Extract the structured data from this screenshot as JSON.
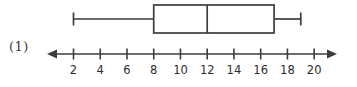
{
  "figure": {
    "item_label": "(1)"
  },
  "chart_data": {
    "type": "boxplot",
    "title": "",
    "label": "(1)",
    "orientation": "horizontal",
    "five_number_summary": {
      "min": 2,
      "q1": 8,
      "median": 12,
      "q3": 17,
      "max": 19
    },
    "axis": {
      "tick_values": [
        2,
        4,
        6,
        8,
        10,
        12,
        14,
        16,
        18,
        20
      ],
      "tick_labels": [
        "2",
        "4",
        "6",
        "8",
        "10",
        "12",
        "14",
        "16",
        "18",
        "20"
      ],
      "tick_step": 2,
      "arrows": "both",
      "shown_range": [
        2,
        20
      ]
    },
    "line_color": "#3d3d3d",
    "label_color": "#2e2e2e",
    "background": "#ffffff"
  }
}
